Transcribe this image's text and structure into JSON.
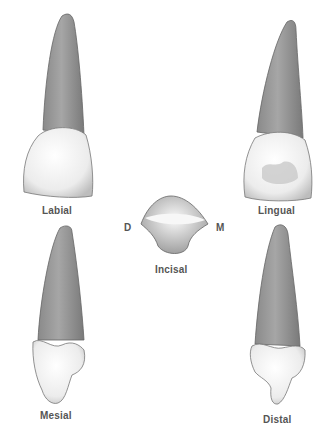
{
  "figure": {
    "views": [
      {
        "id": "labial",
        "label": "Labial"
      },
      {
        "id": "lingual",
        "label": "Lingual"
      },
      {
        "id": "incisal",
        "label": "Incisal"
      },
      {
        "id": "mesial",
        "label": "Mesial"
      },
      {
        "id": "distal",
        "label": "Distal"
      }
    ],
    "orientation": {
      "left": "D",
      "right": "M"
    }
  }
}
